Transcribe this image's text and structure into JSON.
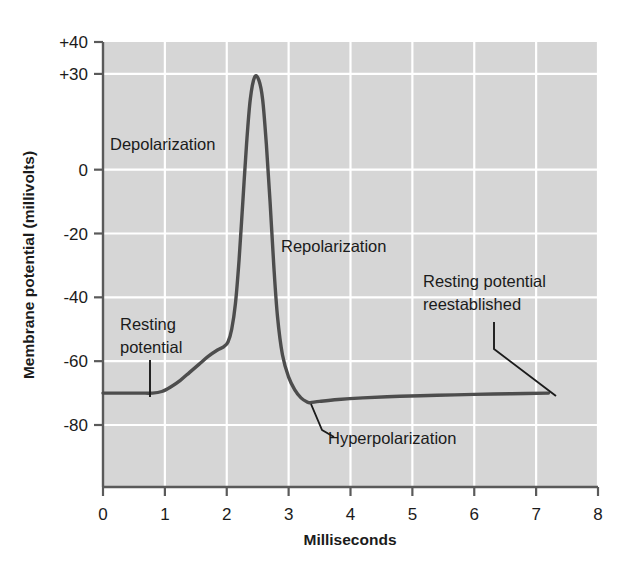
{
  "chart_data": {
    "type": "line",
    "title": "",
    "xlabel": "Milliseconds",
    "ylabel": "Membrane potential (millivolts)",
    "xlim": [
      0,
      8
    ],
    "ylim": [
      -90,
      40
    ],
    "grid": true,
    "legend_position": "none",
    "xticks": [
      "0",
      "1",
      "2",
      "3",
      "4",
      "5",
      "6",
      "7",
      "8"
    ],
    "xtick_values": [
      0,
      1,
      2,
      3,
      4,
      5,
      6,
      7,
      8
    ],
    "yticks": [
      "+40",
      "+30",
      "0",
      "-20",
      "-40",
      "-60",
      "-80"
    ],
    "ytick_values": [
      40,
      30,
      0,
      -20,
      -40,
      -60,
      -80
    ],
    "series": [
      {
        "name": "Action potential",
        "color": "#4d4d4d",
        "x": [
          0.0,
          0.3,
          0.6,
          0.8,
          0.95,
          1.1,
          1.25,
          1.4,
          1.55,
          1.7,
          1.85,
          1.95,
          2.02,
          2.08,
          2.14,
          2.2,
          2.26,
          2.32,
          2.38,
          2.45,
          2.52,
          2.58,
          2.64,
          2.7,
          2.76,
          2.82,
          2.9,
          3.0,
          3.1,
          3.2,
          3.3,
          3.35,
          3.5,
          3.8,
          4.2,
          4.8,
          5.4,
          6.0,
          6.6,
          7.2
        ],
        "y": [
          -70,
          -70,
          -70,
          -70,
          -69.5,
          -68,
          -66,
          -63.5,
          -61,
          -58.5,
          -56.5,
          -55.5,
          -54,
          -50,
          -42,
          -28,
          -10,
          8,
          22,
          29,
          28,
          22,
          8,
          -10,
          -30,
          -46,
          -58,
          -65,
          -69,
          -71.5,
          -72.8,
          -73,
          -72.6,
          -72,
          -71.5,
          -71,
          -70.7,
          -70.4,
          -70.2,
          -70
        ]
      }
    ],
    "annotations": [
      {
        "id": "depolarization",
        "text": "Depolarization",
        "x_ms": 0.12,
        "y_mv": 11
      },
      {
        "id": "repolarization",
        "text": "Repolarization",
        "x_ms": 2.86,
        "y_mv": -23
      },
      {
        "id": "resting-potential",
        "text": "Resting\npotential",
        "line1": "Resting",
        "line2": "potential",
        "x_ms": 0.27,
        "y_mv": -42
      },
      {
        "id": "hyperpolarization",
        "text": "Hyperpolarization",
        "x_ms": 3.62,
        "y_mv": -84
      },
      {
        "id": "resting-potential-reestablished",
        "text": "Resting potential reestablished",
        "line1": "Resting potential",
        "line2": "reestablished",
        "x_ms": 5.17,
        "y_mv": -31
      }
    ]
  },
  "colors": {
    "plot_background": "#d6d6d6",
    "gridline": "#ffffff",
    "axis": "#5a5a5a",
    "curve": "#4d4d4d",
    "text": "#1b1b1b",
    "page_background": "#ffffff"
  }
}
